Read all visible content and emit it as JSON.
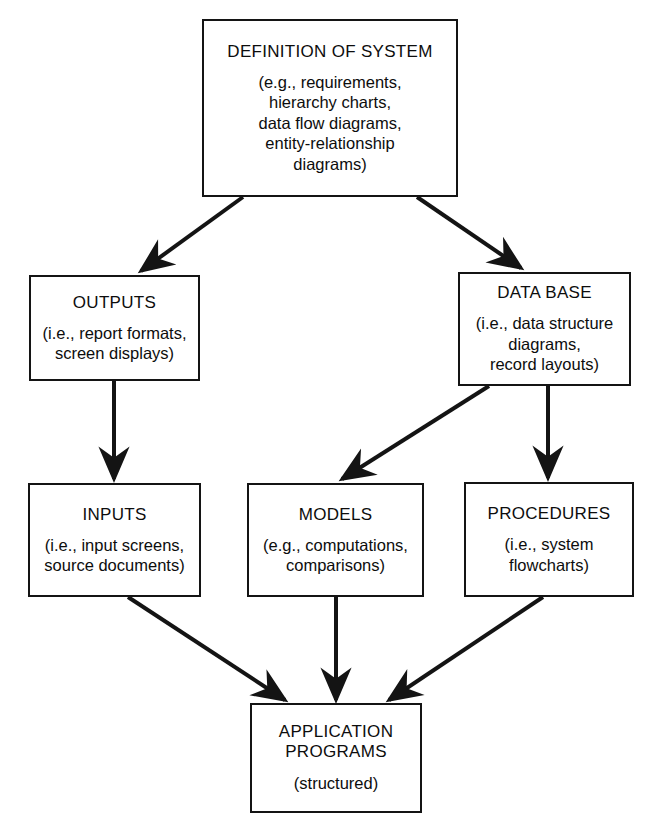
{
  "diagram": {
    "stroke_color": "#141414",
    "background_color": "#ffffff",
    "nodes": [
      {
        "id": "definition-of-system",
        "title": "DEFINITION OF SYSTEM",
        "subtitle": "(e.g., requirements,\nhierarchy charts,\ndata flow diagrams,\nentity-relationship\ndiagrams)"
      },
      {
        "id": "outputs",
        "title": "OUTPUTS",
        "subtitle": "(i.e., report formats,\nscreen displays)"
      },
      {
        "id": "data-base",
        "title": "DATA BASE",
        "subtitle": "(i.e., data structure\ndiagrams,\nrecord layouts)"
      },
      {
        "id": "inputs",
        "title": "INPUTS",
        "subtitle": "(i.e., input screens,\nsource documents)"
      },
      {
        "id": "models",
        "title": "MODELS",
        "subtitle": "(e.g., computations,\ncomparisons)"
      },
      {
        "id": "procedures",
        "title": "PROCEDURES",
        "subtitle": "(i.e., system\nflowcharts)"
      },
      {
        "id": "application-programs",
        "title": "APPLICATION\nPROGRAMS",
        "subtitle": "(structured)"
      }
    ],
    "edges": [
      {
        "id": "definition-to-outputs",
        "from": "definition-of-system",
        "to": "outputs"
      },
      {
        "id": "definition-to-data-base",
        "from": "definition-of-system",
        "to": "data-base"
      },
      {
        "id": "outputs-to-inputs",
        "from": "outputs",
        "to": "inputs"
      },
      {
        "id": "data-base-to-models",
        "from": "data-base",
        "to": "models"
      },
      {
        "id": "data-base-to-procedures",
        "from": "data-base",
        "to": "procedures"
      },
      {
        "id": "inputs-to-application-programs",
        "from": "inputs",
        "to": "application-programs"
      },
      {
        "id": "models-to-application-programs",
        "from": "models",
        "to": "application-programs"
      },
      {
        "id": "procedures-to-application-programs",
        "from": "procedures",
        "to": "application-programs"
      }
    ]
  }
}
